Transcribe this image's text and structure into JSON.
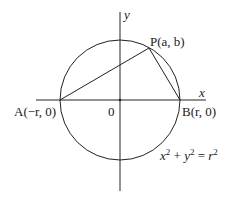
{
  "diagram": {
    "type": "geometry",
    "axes": {
      "x_label": "x",
      "y_label": "y",
      "origin_label": "0"
    },
    "points": {
      "A": {
        "name": "A",
        "coords": "(−r, 0)"
      },
      "B": {
        "name": "B",
        "coords": "(r, 0)"
      },
      "P": {
        "name": "P",
        "coords": "(a, b)"
      }
    },
    "equation": {
      "lhs_x": "x",
      "lhs_y": "y",
      "exp": "2",
      "plus": " + ",
      "eq": " = ",
      "rhs": "r"
    },
    "colors": {
      "stroke": "#222222",
      "background": "#ffffff"
    }
  }
}
